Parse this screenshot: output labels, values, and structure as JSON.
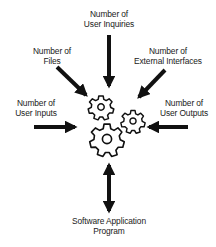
{
  "diagram": {
    "center": {
      "icon": "gears-icon",
      "gear_count": 3
    },
    "inputs": [
      {
        "id": "user-inquiries",
        "lines": [
          "Number of",
          "User Inquiries"
        ],
        "direction": "down"
      },
      {
        "id": "files",
        "lines": [
          "Number of",
          "Files"
        ],
        "direction": "down-right"
      },
      {
        "id": "external-interfaces",
        "lines": [
          "Number of",
          "External Interfaces"
        ],
        "direction": "down-left"
      },
      {
        "id": "user-inputs",
        "lines": [
          "Number of",
          "User Inputs"
        ],
        "direction": "right"
      },
      {
        "id": "user-outputs",
        "lines": [
          "Number of",
          "User Outputs"
        ],
        "direction": "left"
      }
    ],
    "output": {
      "id": "software-application-program",
      "lines": [
        "Software Application",
        "Program"
      ],
      "direction": "bidirectional-vertical"
    },
    "colors": {
      "background": "#ffffff",
      "stroke": "#111111",
      "text": "#1a1a1a"
    }
  }
}
